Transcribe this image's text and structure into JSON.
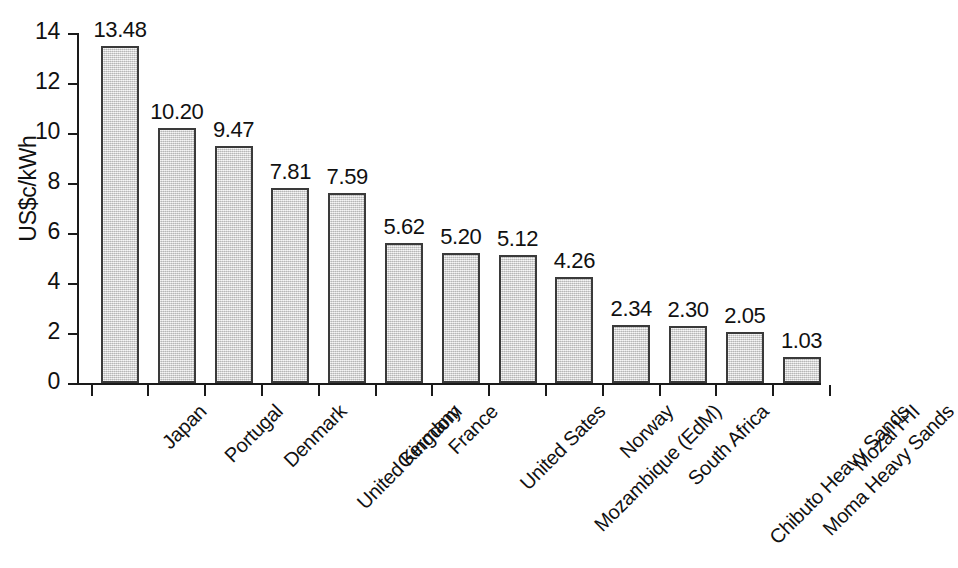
{
  "chart_data": {
    "type": "bar",
    "title": "",
    "subtitle": "",
    "xlabel": "",
    "ylabel": "US$c/kWh",
    "ylim": [
      0,
      14
    ],
    "ytick_values": [
      0,
      2,
      4,
      6,
      8,
      10,
      12,
      14
    ],
    "ytick_labels": [
      "0",
      "2",
      "4",
      "6",
      "8",
      "10",
      "12",
      "14"
    ],
    "grid": false,
    "legend": false,
    "legend_position": "none",
    "bar_fill_color": "#d6d6d6",
    "bar_border_color": "#3a3a3a",
    "axis_color": "#1a1a1a",
    "categories": [
      "Japan",
      "Portugal",
      "Denmark",
      "United Kingdom",
      "Germany",
      "France",
      "United Sates",
      "Mozambique (EdM)",
      "Norway",
      "South Africa",
      "Chibuto Heavy Sands",
      "Moma Heavy Sands",
      "Mozal I+II"
    ],
    "values": [
      13.48,
      10.2,
      9.47,
      7.81,
      7.59,
      5.62,
      5.2,
      5.12,
      4.26,
      2.34,
      2.3,
      2.05,
      1.03
    ],
    "value_labels": [
      "13.48",
      "10.20",
      "9.47",
      "7.81",
      "7.59",
      "5.62",
      "5.20",
      "5.12",
      "4.26",
      "2.34",
      "2.30",
      "2.05",
      "1.03"
    ]
  }
}
